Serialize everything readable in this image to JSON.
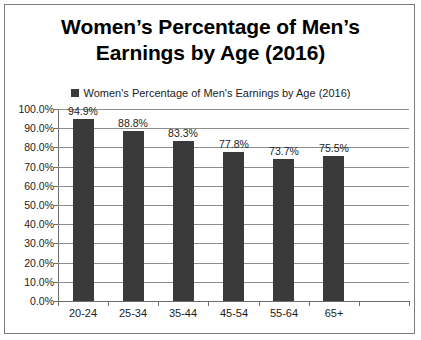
{
  "chart_data": {
    "type": "bar",
    "title": "Women’s Percentage of Men’s Earnings by Age (2016)",
    "title_line1": "Women’s Percentage of Men’s",
    "title_line2": "Earnings by Age (2016)",
    "legend": {
      "position": "top",
      "entries": [
        {
          "name": "Women's Percentage of Men's Earnings by Age (2016)",
          "color": "#3a3a3a"
        }
      ]
    },
    "categories": [
      "20-24",
      "25-34",
      "35-44",
      "45-54",
      "55-64",
      "65+"
    ],
    "values": [
      94.9,
      88.8,
      83.3,
      77.8,
      73.7,
      75.5
    ],
    "value_labels": [
      "94.9%",
      "88.8%",
      "83.3%",
      "77.8%",
      "73.7%",
      "75.5%"
    ],
    "xlabel": "",
    "ylabel": "",
    "ylim": [
      0,
      100
    ],
    "ytick_values": [
      0,
      10,
      20,
      30,
      40,
      50,
      60,
      70,
      80,
      90,
      100
    ],
    "ytick_labels": [
      "0.0%",
      "10.0%",
      "20.0%",
      "30.0%",
      "40.0%",
      "50.0%",
      "60.0%",
      "70.0%",
      "80.0%",
      "90.0%",
      "100.0%"
    ],
    "grid": true,
    "grid_axis": "y",
    "bar_color": "#3a3a3a",
    "grid_color": "#8d8d8d",
    "axis_color": "#6b6b6b",
    "background_color": "#ffffff",
    "border_color": "#7d7d7d",
    "text_color": "#1c1c1c",
    "empty_trailing_slots": 1
  }
}
